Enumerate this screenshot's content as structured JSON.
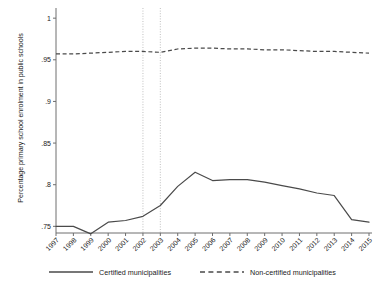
{
  "chart_data": {
    "type": "line",
    "title": "",
    "xlabel": "",
    "ylabel": "Percentage primary school enrolment in public schools",
    "x": [
      1997,
      1998,
      1999,
      2000,
      2001,
      2002,
      2003,
      2004,
      2005,
      2006,
      2007,
      2008,
      2009,
      2010,
      2011,
      2012,
      2013,
      2014,
      2015
    ],
    "xtick_labels": [
      "1997",
      "1998",
      "1999",
      "2000",
      "2001",
      "2002",
      "2003",
      "2004",
      "2005",
      "2006",
      "2007",
      "2008",
      "2009",
      "2010",
      "2011",
      "2012",
      "2013",
      "2014",
      "2015"
    ],
    "ytick_labels": [
      "1",
      ".95",
      ".9",
      ".85",
      ".8",
      ".75"
    ],
    "ytick_values": [
      1,
      0.95,
      0.9,
      0.85,
      0.8,
      0.75
    ],
    "ylim": [
      0.742,
      1.005
    ],
    "xlim": [
      1997,
      2015
    ],
    "grid": false,
    "legend_position": "bottom",
    "vertical_reference_lines": [
      2002,
      2003
    ],
    "series": [
      {
        "name": "Certified municipalities",
        "style": "solid",
        "color": "#4a4a4a",
        "values": [
          0.75,
          0.75,
          0.741,
          0.755,
          0.757,
          0.762,
          0.775,
          0.798,
          0.815,
          0.805,
          0.806,
          0.806,
          0.803,
          0.799,
          0.795,
          0.79,
          0.787,
          0.758,
          0.755
        ]
      },
      {
        "name": "Non-certified municipalities",
        "style": "dashed",
        "color": "#4a4a4a",
        "values": [
          0.957,
          0.957,
          0.958,
          0.959,
          0.96,
          0.96,
          0.959,
          0.963,
          0.964,
          0.964,
          0.963,
          0.963,
          0.962,
          0.962,
          0.961,
          0.96,
          0.96,
          0.959,
          0.958
        ]
      }
    ]
  },
  "legend": {
    "entries": [
      {
        "label": "Certified municipalities",
        "style": "solid"
      },
      {
        "label": "Non-certified municipalities",
        "style": "dashed"
      }
    ]
  }
}
